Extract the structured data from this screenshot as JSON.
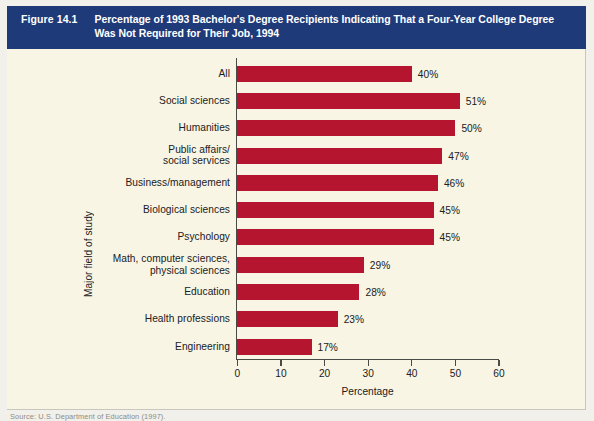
{
  "figure": {
    "number": "Figure 14.1",
    "title_line1": "Percentage of 1993 Bachelor's Degree Recipients Indicating That a Four-Year College Degree",
    "title_line2": "Was Not Required for Their Job, 1994",
    "header_color": "#1f3a79",
    "page_color": "#f8f5e4",
    "source": "Source: U.S. Department of Education (1997)."
  },
  "chart_data": {
    "type": "bar",
    "orientation": "horizontal",
    "title": "Percentage of 1993 Bachelor's Degree Recipients Indicating That a Four-Year College Degree Was Not Required for Their Job, 1994",
    "xlabel": "Percentage",
    "ylabel": "Major field of study",
    "xlim": [
      0,
      60
    ],
    "xticks": [
      0,
      10,
      20,
      30,
      40,
      50,
      60
    ],
    "xtick_labels": [
      "0",
      "10",
      "20",
      "30",
      "40",
      "50",
      "60"
    ],
    "grid": false,
    "legend": null,
    "bar_color": "#b5152f",
    "categories": [
      "All",
      "Social sciences",
      "Humanities",
      "Public affairs/ social services",
      "Business/management",
      "Biological sciences",
      "Psychology",
      "Math, computer sciences, physical sciences",
      "Education",
      "Health professions",
      "Engineering"
    ],
    "values": [
      40,
      51,
      50,
      47,
      46,
      45,
      45,
      29,
      28,
      23,
      17
    ],
    "data_labels": [
      "40%",
      "51%",
      "50%",
      "47%",
      "46%",
      "45%",
      "45%",
      "29%",
      "28%",
      "23%",
      "17%"
    ]
  },
  "rows": [
    {
      "label1": "All",
      "label2": "",
      "value": 40,
      "data_label": "40%"
    },
    {
      "label1": "Social sciences",
      "label2": "",
      "value": 51,
      "data_label": "51%"
    },
    {
      "label1": "Humanities",
      "label2": "",
      "value": 50,
      "data_label": "50%"
    },
    {
      "label1": "Public affairs/",
      "label2": "social services",
      "value": 47,
      "data_label": "47%"
    },
    {
      "label1": "Business/management",
      "label2": "",
      "value": 46,
      "data_label": "46%"
    },
    {
      "label1": "Biological sciences",
      "label2": "",
      "value": 45,
      "data_label": "45%"
    },
    {
      "label1": "Psychology",
      "label2": "",
      "value": 45,
      "data_label": "45%"
    },
    {
      "label1": "Math, computer sciences,",
      "label2": "physical sciences",
      "value": 29,
      "data_label": "29%"
    },
    {
      "label1": "Education",
      "label2": "",
      "value": 28,
      "data_label": "28%"
    },
    {
      "label1": "Health professions",
      "label2": "",
      "value": 23,
      "data_label": "23%"
    },
    {
      "label1": "Engineering",
      "label2": "",
      "value": 17,
      "data_label": "17%"
    }
  ]
}
